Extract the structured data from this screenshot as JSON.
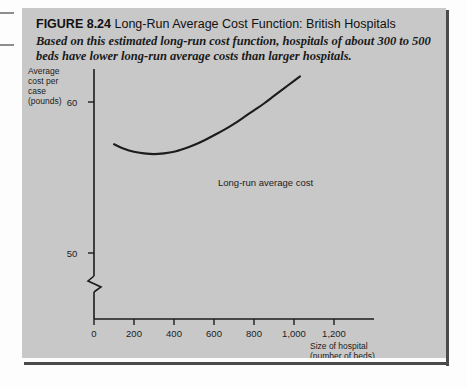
{
  "figure": {
    "label": "FIGURE 8.24",
    "title": "Long-Run Average Cost Function: British Hospitals",
    "caption": "Based on this estimated long-run cost function, hospitals of about 300 to 500 beds have lower long-run average costs than larger hospitals."
  },
  "colors": {
    "panel": "#c8c8c8",
    "panel_shadow": "#4a4a4a",
    "ink": "#1c1c1c",
    "page": "#fdfdfd"
  },
  "chart_data": {
    "type": "line",
    "title": "Long-Run Average Cost Function: British Hospitals",
    "xlabel_lines": [
      "Size of hospital",
      "(number of beds)"
    ],
    "ylabel_lines": [
      "Average",
      "cost per",
      "case",
      "(pounds)"
    ],
    "xlabel": "Size of hospital (number of beds)",
    "ylabel": "Average cost per case (pounds)",
    "x_ticks": [
      0,
      200,
      400,
      600,
      800,
      1000,
      1200
    ],
    "x_tick_labels": [
      "0",
      "200",
      "400",
      "600",
      "800",
      "1,000",
      "1,200"
    ],
    "y_ticks": [
      50,
      60
    ],
    "y_tick_labels": [
      "50",
      "60"
    ],
    "xlim": [
      0,
      1300
    ],
    "ylim": [
      47,
      62
    ],
    "y_axis_break": true,
    "grid": false,
    "legend": false,
    "series": [
      {
        "name": "Long-run average cost",
        "annotation": "Long-run average cost",
        "x": [
          100,
          150,
          200,
          250,
          300,
          350,
          400,
          450,
          500,
          550,
          600,
          650,
          700,
          750,
          800,
          850,
          900,
          950,
          1000,
          1030
        ],
        "y": [
          57.2,
          56.9,
          56.7,
          56.6,
          56.55,
          56.6,
          56.7,
          56.9,
          57.15,
          57.45,
          57.8,
          58.15,
          58.55,
          59.0,
          59.45,
          59.9,
          60.4,
          60.9,
          61.4,
          61.7
        ]
      }
    ],
    "annotations": [
      {
        "text": "Long-run average cost",
        "x": 540,
        "y": 57.0
      }
    ]
  }
}
